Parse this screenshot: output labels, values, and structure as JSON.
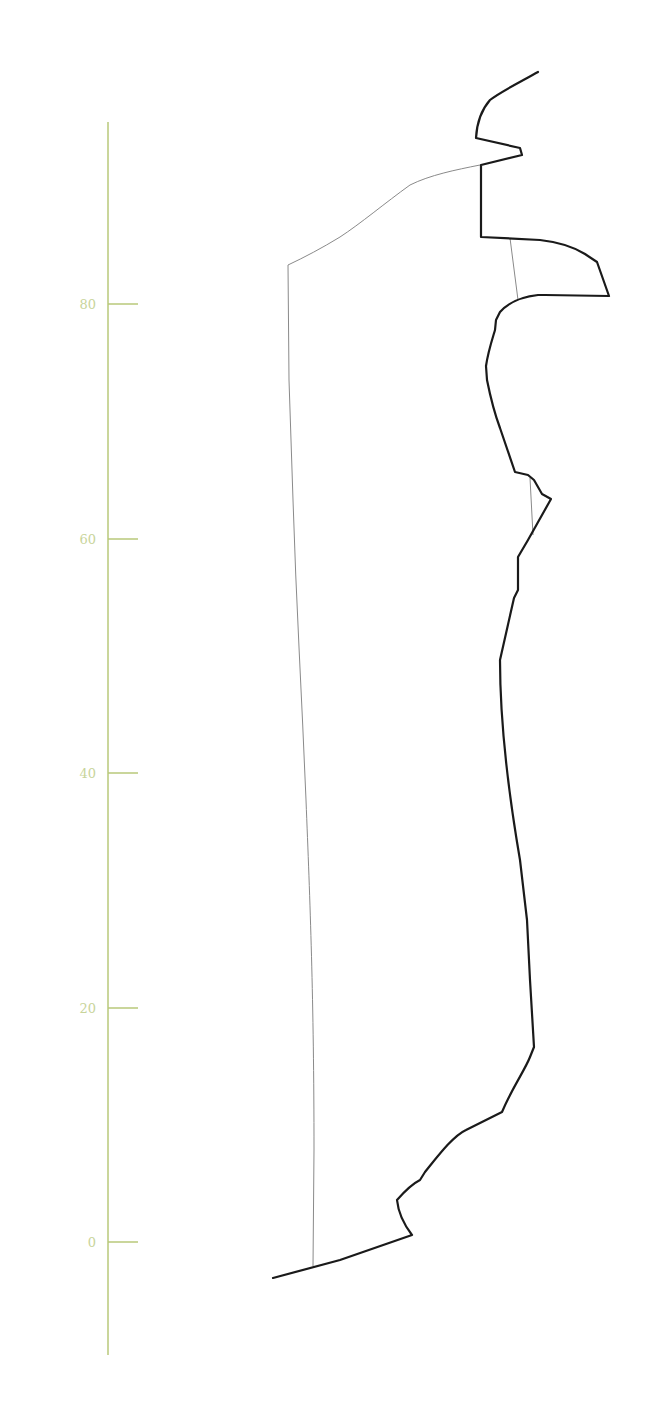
{
  "diagram": {
    "type": "profile-section",
    "colors": {
      "axis": "#b9c87a",
      "tick_label": "#c8d49a",
      "outline": "#1a1a1a",
      "inner_line": "#8a8a8a",
      "background": "#ffffff"
    },
    "axis": {
      "x": 108,
      "y_top": 122,
      "y_bottom": 1355,
      "tick_length": 30,
      "ticks": [
        {
          "value": 80,
          "label": "80",
          "y": 304
        },
        {
          "value": 60,
          "label": "60",
          "y": 539
        },
        {
          "value": 40,
          "label": "40",
          "y": 773
        },
        {
          "value": 20,
          "label": "20",
          "y": 1008
        },
        {
          "value": 0,
          "label": "0",
          "y": 1242
        }
      ]
    },
    "outline_path": "M538,72 C520,82 500,92 490,100 C483,108 477,120 476,138 L520,148 L522,155 L481,165 L481,237 L540,240 C558,242 572,246 585,254 L597,262 L609,296 L545,295 L538,295 C520,297 508,303 500,312 L496,320 L495,330 C492,340 488,352 486,366 L487,380 C490,395 494,412 500,428 L515,472 L528,475 L534,480 L542,494 L551,499 L528,540 L518,557 L518,590 L514,598 L500,660 C500,720 508,790 520,860 L527,920 L530,980 L534,1047 L530,1057 C525,1070 512,1088 502,1112 C490,1118 478,1124 466,1130 C453,1136 438,1156 425,1172 L420,1180 C412,1184 404,1192 397,1200 C398,1210 402,1222 412,1235 L340,1260 L273,1278",
    "inner_line_path": "M313,1266 L314,1150 C314,1000 310,900 306,800 C302,700 296,600 293,500 L289,380 L288,265 C305,257 322,248 340,237 C360,224 385,203 410,185 C430,175 455,170 480,165",
    "connectors": [
      {
        "path": "M510,238 L518,300"
      },
      {
        "path": "M530,478 L533,535"
      }
    ]
  }
}
